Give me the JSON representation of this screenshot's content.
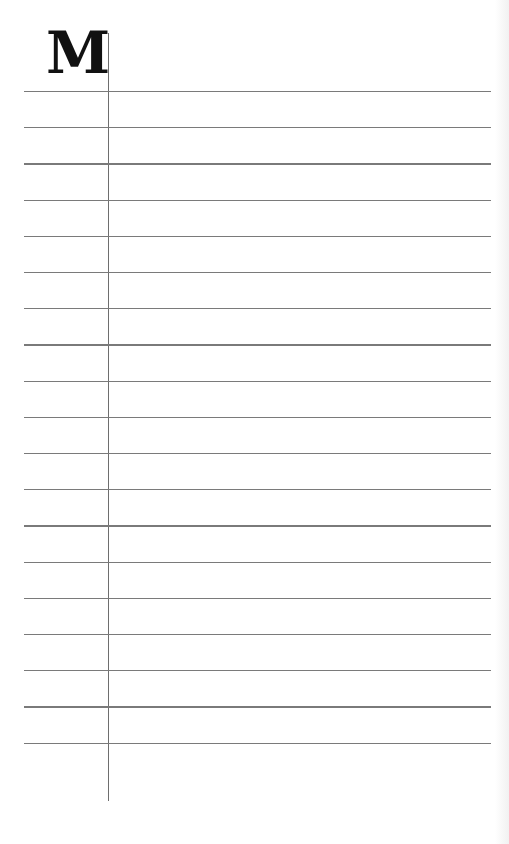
{
  "page": {
    "type": "lined-notebook-page",
    "initial_letter": "M",
    "line_count": 19,
    "first_line_y": 91,
    "line_spacing": 36.2,
    "margin_x": 108,
    "line_color": "#7a7a7a",
    "background": "#ffffff"
  }
}
